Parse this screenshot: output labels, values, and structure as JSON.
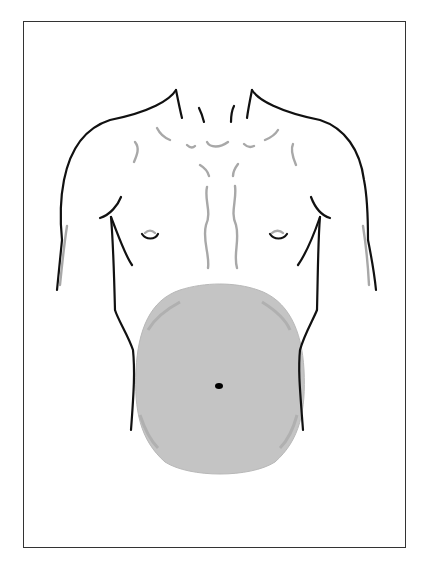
{
  "figure": {
    "highlighted_region": "abdomen",
    "colors": {
      "outline": "#111111",
      "muscle_lines": "#a8a8a8",
      "shading": "#c4c4c4",
      "shading_edge": "#b0b0b0",
      "navel": "#000000",
      "frame": "#333333"
    },
    "frame": {
      "x": 23,
      "y": 21,
      "w": 383,
      "h": 527
    },
    "abdomen_region": {
      "cx": 221,
      "cy": 380,
      "rx": 88,
      "ry": 96
    },
    "navel": {
      "cx": 219,
      "cy": 386,
      "rx": 4,
      "ry": 3
    }
  }
}
